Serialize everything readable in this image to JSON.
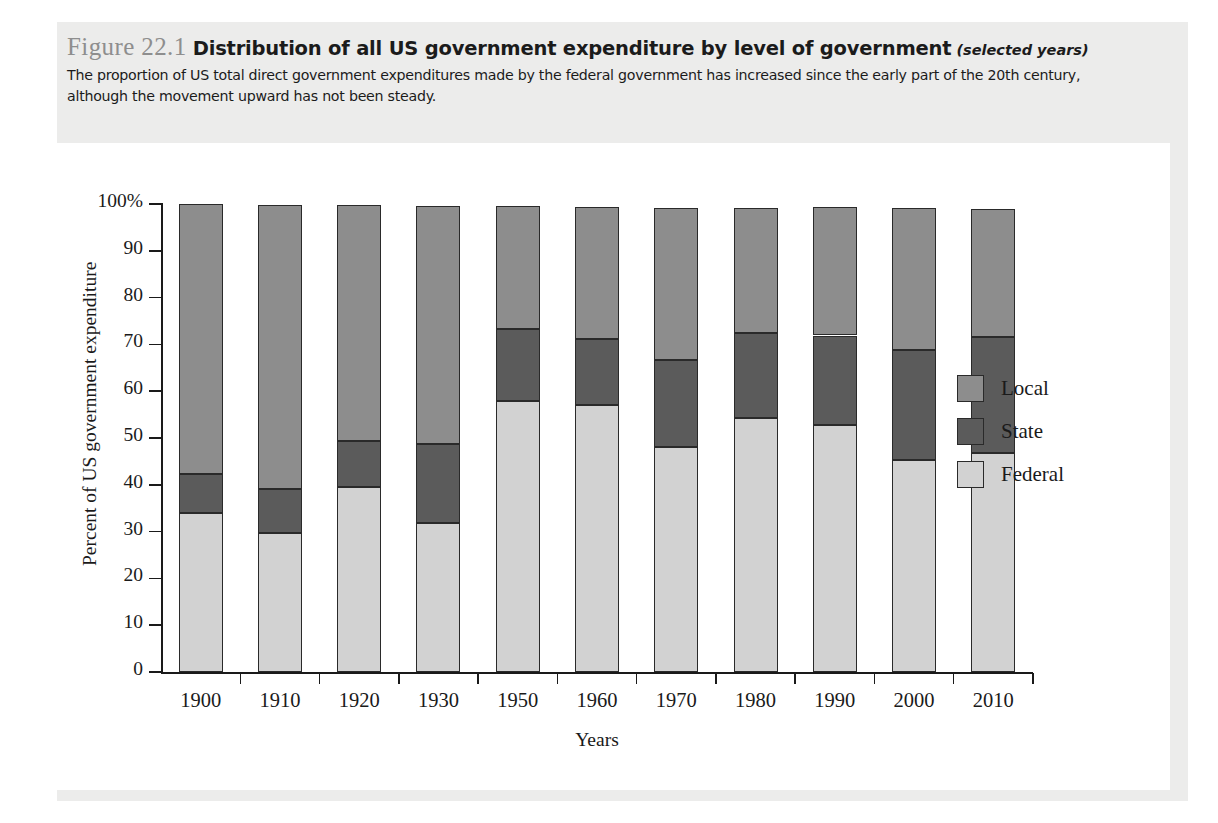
{
  "figure": {
    "number": "Figure 22.1",
    "title": "Distribution of all US government expenditure by level of government",
    "title_note": "(selected years)",
    "caption": "The proportion of US total direct government expenditures made by the federal government has increased since the early part of the 20th century, although the movement upward has not been steady."
  },
  "colors": {
    "federal": "#d2d2d2",
    "state": "#5b5b5b",
    "local": "#8d8d8d",
    "outline": "#2a2a2a",
    "panel_background": "#ececeb",
    "plot_background": "#ffffff",
    "figure_number": "#8e8e8e"
  },
  "legend": {
    "position": "right",
    "items": [
      {
        "label": "Local",
        "color": "#8d8d8d"
      },
      {
        "label": "State",
        "color": "#5b5b5b"
      },
      {
        "label": "Federal",
        "color": "#d2d2d2"
      }
    ]
  },
  "chart_data": {
    "type": "bar",
    "subtype": "stacked-100-percent",
    "title": "Distribution of all US government expenditure by level of government",
    "xlabel": "Years",
    "ylabel": "Percent of US government expenditure",
    "ylim": [
      0,
      100
    ],
    "yticks": [
      0,
      10,
      20,
      30,
      40,
      50,
      60,
      70,
      80,
      90,
      100
    ],
    "ytick_labels": [
      "0",
      "10",
      "20",
      "30",
      "40",
      "50",
      "60",
      "70",
      "80",
      "90",
      "100%"
    ],
    "grid": false,
    "categories": [
      "1900",
      "1910",
      "1920",
      "1930",
      "1950",
      "1960",
      "1970",
      "1980",
      "1990",
      "2000",
      "2010"
    ],
    "series": [
      {
        "name": "Federal",
        "color": "#d2d2d2",
        "values": [
          34.0,
          29.8,
          39.5,
          31.9,
          58.0,
          57.0,
          48.0,
          54.2,
          52.7,
          45.4,
          46.9
        ]
      },
      {
        "name": "State",
        "color": "#5b5b5b",
        "values": [
          8.3,
          9.4,
          9.9,
          16.8,
          15.3,
          14.2,
          18.6,
          18.2,
          19.2,
          23.4,
          24.7
        ]
      },
      {
        "name": "Local",
        "color": "#8d8d8d",
        "values": [
          57.7,
          60.5,
          50.3,
          50.9,
          26.2,
          28.2,
          32.6,
          26.8,
          27.4,
          30.4,
          27.4
        ]
      }
    ],
    "stack_tops": {
      "federal_top": [
        34.0,
        29.8,
        39.5,
        31.9,
        58.0,
        57.0,
        48.0,
        54.2,
        52.7,
        45.4,
        46.9
      ],
      "federal_state_top": [
        42.3,
        39.2,
        49.4,
        48.7,
        73.3,
        71.2,
        66.6,
        72.4,
        71.9,
        68.8,
        71.6
      ],
      "total_top": [
        100.0,
        99.7,
        99.7,
        99.6,
        99.5,
        99.4,
        99.2,
        99.2,
        99.3,
        99.2,
        99.0
      ]
    }
  }
}
